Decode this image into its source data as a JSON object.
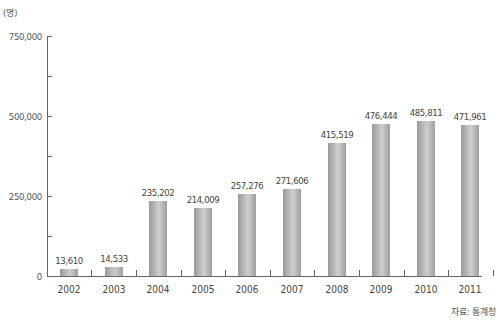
{
  "chart_data": {
    "type": "bar",
    "title": "",
    "xlabel": "",
    "ylabel": "(명)",
    "ylim": [
      0,
      750000
    ],
    "yticks": [
      0,
      250000,
      500000,
      750000
    ],
    "ytick_labels": [
      "0",
      "250,000",
      "500,000",
      "750,000"
    ],
    "categories": [
      "2002",
      "2003",
      "2004",
      "2005",
      "2006",
      "2007",
      "2008",
      "2009",
      "2010",
      "2011"
    ],
    "values": [
      13610,
      14533,
      235202,
      214009,
      257276,
      271606,
      415519,
      476444,
      485811,
      471961
    ],
    "value_labels": [
      "13,610",
      "14,533",
      "235,202",
      "214,009",
      "257,276",
      "271,606",
      "415,519",
      "476,444",
      "485,811",
      "471,961"
    ],
    "grid": false,
    "legend": null,
    "source": "자료: 통계청",
    "bar_color": "#b8b8b8"
  },
  "labels": {
    "unit": "(명)",
    "source": "자료: 통계청"
  }
}
